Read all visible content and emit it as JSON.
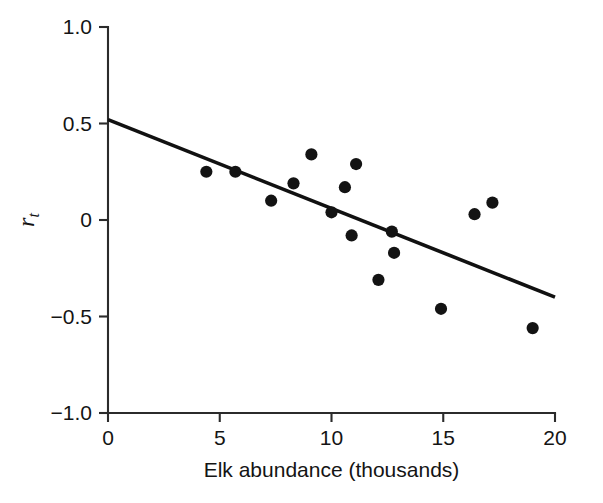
{
  "chart_data": {
    "type": "scatter",
    "title": "",
    "xlabel": "Elk abundance (thousands)",
    "ylabel": "r_t",
    "ylabel_base": "r",
    "ylabel_sub": "t",
    "xlim": [
      0,
      20
    ],
    "ylim": [
      -1.0,
      1.0
    ],
    "xticks": [
      0,
      5,
      10,
      15,
      20
    ],
    "xtick_labels": [
      "0",
      "5",
      "10",
      "15",
      "20"
    ],
    "yticks": [
      1.0,
      0.5,
      0,
      -0.5,
      -1.0
    ],
    "ytick_labels": [
      "1.0",
      "0.5",
      "0",
      "−0.5",
      "−1.0"
    ],
    "grid": false,
    "legend": null,
    "point_color": "#131313",
    "line_color": "#111111",
    "axis_color": "#2b2b2b",
    "points": [
      {
        "x": 4.4,
        "y": 0.25
      },
      {
        "x": 5.7,
        "y": 0.25
      },
      {
        "x": 7.3,
        "y": 0.1
      },
      {
        "x": 8.3,
        "y": 0.19
      },
      {
        "x": 9.1,
        "y": 0.34
      },
      {
        "x": 10.0,
        "y": 0.04
      },
      {
        "x": 10.6,
        "y": 0.17
      },
      {
        "x": 10.9,
        "y": -0.08
      },
      {
        "x": 11.1,
        "y": 0.29
      },
      {
        "x": 12.1,
        "y": -0.31
      },
      {
        "x": 12.7,
        "y": -0.06
      },
      {
        "x": 12.8,
        "y": -0.17
      },
      {
        "x": 14.9,
        "y": -0.46
      },
      {
        "x": 16.4,
        "y": 0.03
      },
      {
        "x": 17.2,
        "y": 0.09
      },
      {
        "x": 19.0,
        "y": -0.56
      }
    ],
    "fit_line": {
      "x_start": 0,
      "y_start": 0.52,
      "x_end": 20,
      "y_end": -0.4,
      "slope": -0.046,
      "intercept": 0.52
    }
  }
}
